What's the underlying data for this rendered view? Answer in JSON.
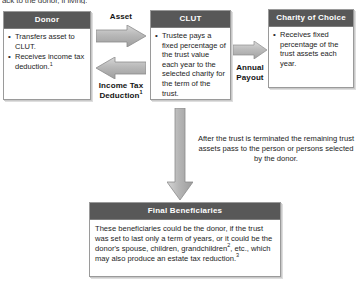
{
  "diagram": {
    "cut_top_line": "ack to the donor, if living:",
    "boxes": [
      {
        "id": "donor",
        "title": "Donor",
        "bullets": [
          "Transfers asset to CLUT.",
          "Receives income tax deduction."
        ],
        "bullet_superscripts": [
          "",
          "1"
        ]
      },
      {
        "id": "clut",
        "title": "CLUT",
        "bullets": [
          "Trustee pays a fixed percentage of the trust value each year to the selected charity for the term of the trust."
        ],
        "bullet_superscripts": [
          ""
        ]
      },
      {
        "id": "charity",
        "title": "Charity of Choice",
        "bullets": [
          "Receives fixed percentage of the trust assets each year."
        ],
        "bullet_superscripts": [
          ""
        ]
      }
    ],
    "beneficiaries": {
      "title": "Final Beneficiaries",
      "text_part_1": "These beneficiaries could be the donor, if the trust was set to last only a term of years, or it could be the donor's spouse, children, grandchildren",
      "superscript_1": "2",
      "text_part_2": ", etc., which may also produce an estate tax reduction.",
      "superscript_2": "3"
    },
    "arrow_labels": {
      "asset": "Asset",
      "income_tax_line1": "Income Tax",
      "income_tax_line2": "Deduction",
      "income_tax_superscript": "1",
      "annual_line1": "Annual",
      "annual_line2": "Payout"
    },
    "note": "After the trust is terminated the remaining trust assets pass to the person or persons selected by the donor.",
    "colors": {
      "header_bg": "#585858",
      "header_text": "#ffffff",
      "box_border": "#9a9a9a",
      "arrow_fill": "#b4b4b4",
      "arrow_stroke": "#8a8a8a",
      "page_bg": "#ffffff",
      "body_text": "#1d1d1d"
    },
    "icons": {
      "arrow_right": "arrow-right-icon",
      "arrow_left": "arrow-left-icon",
      "arrow_down": "arrow-down-icon",
      "bullet": "bullet-dot-icon"
    }
  }
}
